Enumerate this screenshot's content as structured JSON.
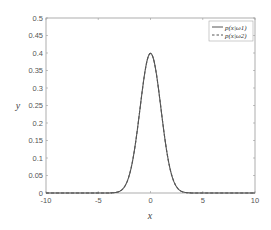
{
  "chart_data": {
    "type": "line",
    "title": "",
    "xlabel": "x",
    "ylabel": "y",
    "xlim": [
      -10,
      10
    ],
    "ylim": [
      0,
      0.5
    ],
    "xticks": [
      "-10",
      "-5",
      "0",
      "5",
      "10"
    ],
    "xtick_values": [
      -10,
      -5,
      0,
      5,
      10
    ],
    "yticks": [
      "0",
      "0.05",
      "0.1",
      "0.15",
      "0.2",
      "0.25",
      "0.3",
      "0.35",
      "0.4",
      "0.45",
      "0.5"
    ],
    "ytick_values": [
      0,
      0.05,
      0.1,
      0.15,
      0.2,
      0.25,
      0.3,
      0.35,
      0.4,
      0.45,
      0.5
    ],
    "grid": false,
    "legend_position": "top-right",
    "series": [
      {
        "name": "p(x|ω1)",
        "style": "solid",
        "color": "#555555",
        "distribution": "normal",
        "mean": 0,
        "std": 1,
        "peak": 0.399
      },
      {
        "name": "p(x|ω2)",
        "style": "dashed",
        "color": "#555555",
        "distribution": "normal",
        "mean": 0,
        "std": 1,
        "peak": 0.399
      }
    ]
  }
}
